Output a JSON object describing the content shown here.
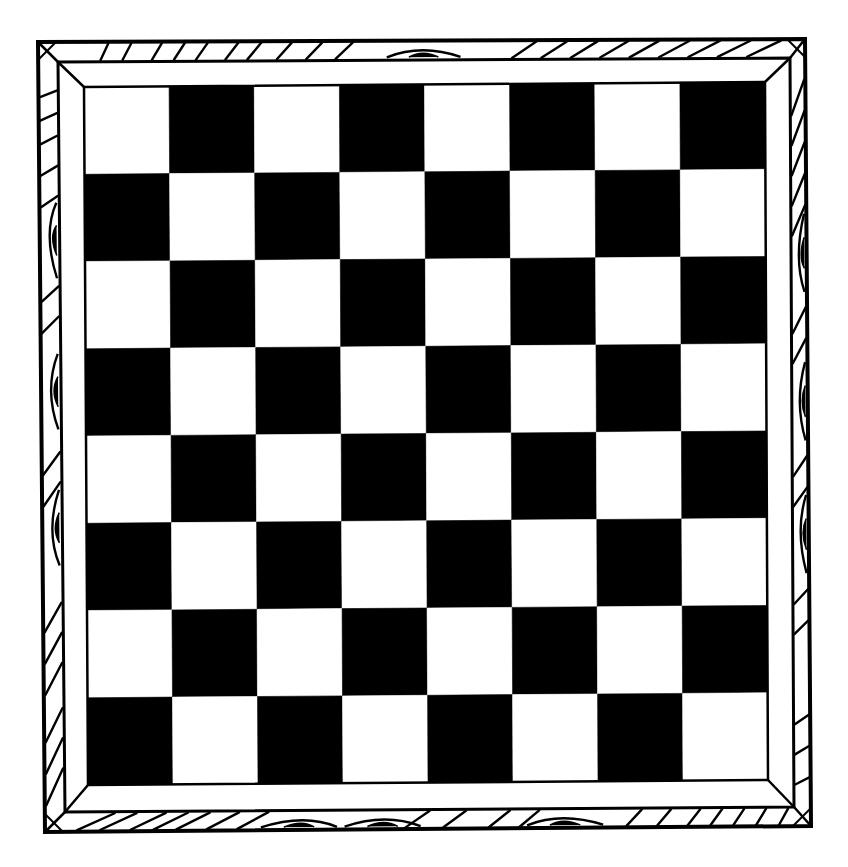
{
  "image": {
    "subject": "Empty chessboard with carved wood-grain frame, black and white line art",
    "colors": {
      "background": "#ffffff",
      "ink": "#000000",
      "light_square": "#ffffff",
      "dark_square": "#000000"
    }
  },
  "board": {
    "files": 8,
    "ranks": 8,
    "top_left_square": "light",
    "pattern_rows": [
      [
        "light",
        "dark",
        "light",
        "dark",
        "light",
        "dark",
        "light",
        "dark"
      ],
      [
        "dark",
        "light",
        "dark",
        "light",
        "dark",
        "light",
        "dark",
        "light"
      ],
      [
        "light",
        "dark",
        "light",
        "dark",
        "light",
        "dark",
        "light",
        "dark"
      ],
      [
        "dark",
        "light",
        "dark",
        "light",
        "dark",
        "light",
        "dark",
        "light"
      ],
      [
        "light",
        "dark",
        "light",
        "dark",
        "light",
        "dark",
        "light",
        "dark"
      ],
      [
        "dark",
        "light",
        "dark",
        "light",
        "dark",
        "light",
        "dark",
        "light"
      ],
      [
        "light",
        "dark",
        "light",
        "dark",
        "light",
        "dark",
        "light",
        "dark"
      ],
      [
        "dark",
        "light",
        "dark",
        "light",
        "dark",
        "light",
        "dark",
        "light"
      ]
    ],
    "pieces": []
  },
  "frame": {
    "style": "wood-grain",
    "sides": [
      "top",
      "right",
      "bottom",
      "left"
    ],
    "inner_bevel": "plain white",
    "corner_style": "mitered"
  }
}
